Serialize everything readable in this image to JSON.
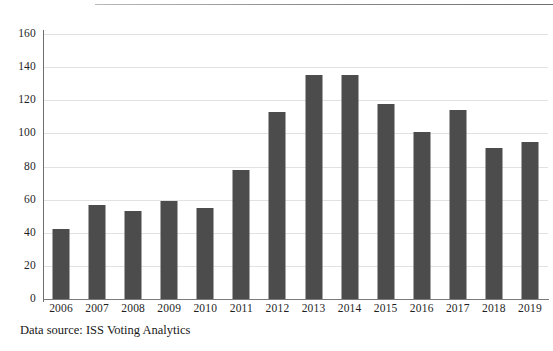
{
  "document": {
    "clipped_header_fragment": "■■■■■■■■■■",
    "source_note": "Data source: ISS Voting Analytics"
  },
  "colors": {
    "bar": "#4c4c4c",
    "gridline": "#e2e2e0",
    "axis": "#6e6e6e",
    "background": "#ffffff",
    "text": "#1f1f1f"
  },
  "chart_data": {
    "type": "bar",
    "title": "",
    "subtitle": "",
    "xlabel": "",
    "ylabel": "",
    "categories": [
      "2006",
      "2007",
      "2008",
      "2009",
      "2010",
      "2011",
      "2012",
      "2013",
      "2014",
      "2015",
      "2016",
      "2017",
      "2018",
      "2019"
    ],
    "values": [
      42,
      57,
      53,
      59,
      55,
      78,
      113,
      135,
      135,
      118,
      101,
      114,
      91,
      95
    ],
    "series": [
      {
        "name": "Count",
        "values": [
          42,
          57,
          53,
          59,
          55,
          78,
          113,
          135,
          135,
          118,
          101,
          114,
          91,
          95
        ]
      }
    ],
    "ylim": [
      0,
      160
    ],
    "ytick_step": 20,
    "yticks": [
      0,
      20,
      40,
      60,
      80,
      100,
      120,
      140,
      160
    ],
    "ytick_labels": [
      "0",
      "20",
      "40",
      "60",
      "80",
      "100",
      "120",
      "140",
      "160"
    ],
    "grid": true,
    "grid_axis": "y",
    "legend": false,
    "legend_position": "none",
    "annotations": [
      "Data source: ISS Voting Analytics"
    ]
  }
}
